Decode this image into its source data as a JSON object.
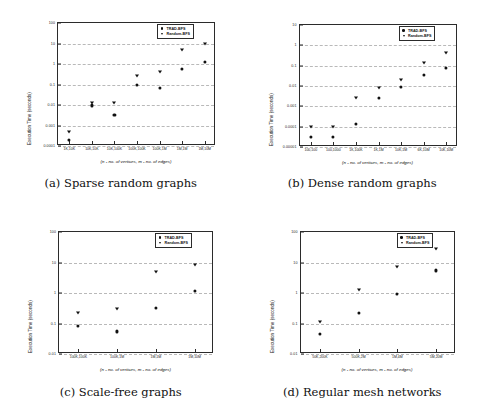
{
  "figure": {
    "axis_xlabel": "(n - no. of vertices, m - no. of edges)",
    "axis_ylabel": "Execution Time (seconds)",
    "legend": [
      {
        "label": "TRAD-BFS",
        "marker": "circle"
      },
      {
        "label": "Random-BFS",
        "marker": "triangle-down"
      }
    ]
  },
  "chart_data": [
    {
      "type": "scatter",
      "panel": "a",
      "caption": "(a) Sparse random graphs",
      "title": "",
      "xlabel": "(n - no. of vertices, m - no. of edges)",
      "ylabel": "Execution Time (seconds)",
      "yscale": "log",
      "ylim": [
        0.0001,
        100
      ],
      "yticks": [
        "100",
        "10",
        "1",
        "0.1",
        "0.01",
        "0.001",
        "0.0001"
      ],
      "grid": true,
      "legend_position": "top-right",
      "categories": [
        "1K,10K",
        "10K,10K",
        "10K,100K",
        "100K,100K",
        "100K,1M",
        "1M,1M",
        "1M,10M"
      ],
      "series": [
        {
          "name": "TRAD-BFS",
          "marker": "circle",
          "values": [
            0.0002,
            0.0095,
            0.0032,
            0.095,
            0.07,
            0.55,
            1.3
          ]
        },
        {
          "name": "Random-BFS",
          "marker": "triangle-down",
          "values": [
            0.0005,
            0.013,
            0.012,
            0.25,
            0.4,
            5.0,
            9.0
          ]
        }
      ]
    },
    {
      "type": "scatter",
      "panel": "b",
      "caption": "(b) Dense random graphs",
      "title": "",
      "xlabel": "(n - no. of vertices, m - no. of edges)",
      "ylabel": "Execution Time (seconds)",
      "yscale": "log",
      "ylim": [
        1e-05,
        10
      ],
      "yticks": [
        "10",
        "1",
        "0.1",
        "0.01",
        "0.001",
        "0.0001",
        "0.00001"
      ],
      "grid": true,
      "legend_position": "top-right",
      "categories": [
        "100,100",
        "100,1000",
        "1K,100K",
        "1K,1M",
        "10K,1M",
        "6K,10M",
        "10K,10M"
      ],
      "series": [
        {
          "name": "TRAD-BFS",
          "marker": "circle",
          "values": [
            3e-05,
            3e-05,
            0.00013,
            0.0025,
            0.009,
            0.035,
            0.075,
            0.12
          ]
        },
        {
          "name": "Random-BFS",
          "marker": "triangle-down",
          "values": [
            0.0001,
            0.0001,
            0.0025,
            0.008,
            0.02,
            0.13,
            0.4
          ]
        }
      ]
    },
    {
      "type": "scatter",
      "panel": "c",
      "caption": "(c) Scale-free graphs",
      "title": "",
      "xlabel": "(n - no. of vertices, m - no. of edges)",
      "ylabel": "Execution Time (seconds)",
      "yscale": "log",
      "ylim": [
        0.01,
        100
      ],
      "yticks": [
        "100",
        "10",
        "1",
        "0.1",
        "0.01"
      ],
      "grid": true,
      "legend_position": "top-right",
      "categories": [
        "100K,100K",
        "100K,1M",
        "1M,1M",
        "1M,10M"
      ],
      "series": [
        {
          "name": "TRAD-BFS",
          "marker": "circle",
          "values": [
            0.085,
            0.055,
            0.32,
            1.2
          ]
        },
        {
          "name": "Random-BFS",
          "marker": "triangle-down",
          "values": [
            0.22,
            0.3,
            5.0,
            8.0
          ]
        }
      ]
    },
    {
      "type": "scatter",
      "panel": "d",
      "caption": "(d) Regular mesh networks",
      "title": "",
      "xlabel": "(n - no. of vertices, m - no. of edges)",
      "ylabel": "Execution Time (seconds)",
      "yscale": "log",
      "ylim": [
        0.01,
        100
      ],
      "yticks": [
        "100",
        "10",
        "1",
        "0.1",
        "0.01"
      ],
      "grid": true,
      "legend_position": "top-right",
      "categories": [
        "50K,200K",
        "500K,2M",
        "1M,4M",
        "5M,20M"
      ],
      "series": [
        {
          "name": "TRAD-BFS",
          "marker": "circle",
          "values": [
            0.045,
            0.22,
            0.92,
            5.5
          ]
        },
        {
          "name": "Random-BFS",
          "marker": "triangle-down",
          "values": [
            0.11,
            1.3,
            7.0,
            28
          ]
        }
      ]
    }
  ]
}
